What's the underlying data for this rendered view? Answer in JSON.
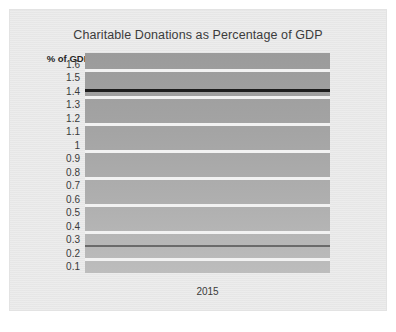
{
  "chart_data": {
    "type": "line",
    "title": "Charitable Donations as Percentage of GDP",
    "xlabel": "",
    "ylabel": "% of GDP",
    "categories": [
      "2015"
    ],
    "x": [
      "2015"
    ],
    "tick_labels": [
      "1.6",
      "1.5",
      "1.4",
      "1.3",
      "1.2",
      "1.1",
      "1",
      "0.9",
      "0.8",
      "0.7",
      "0.6",
      "0.5",
      "0.4",
      "0.3",
      "0.2",
      "0.1"
    ],
    "ylim": [
      0.05,
      1.68
    ],
    "grid": true,
    "gridline_values": [
      1.55,
      1.35,
      1.15,
      0.95,
      0.75,
      0.55,
      0.35,
      0.15
    ],
    "legend": "none",
    "series": [
      {
        "name": "series-1",
        "values": [
          1.4
        ],
        "color": "#1d1d1d",
        "style": "flat-horizontal-line"
      },
      {
        "name": "series-2",
        "values": [
          0.25
        ],
        "color": "#5d5d5d",
        "style": "flat-horizontal-line"
      }
    ],
    "plot_background": "#a8a8a8",
    "gridline_color": "#f2f2f2"
  },
  "chart": {
    "title": "Charitable Donations as Percentage of GDP",
    "axis_title": "% of GDP",
    "x_category": "2015"
  }
}
